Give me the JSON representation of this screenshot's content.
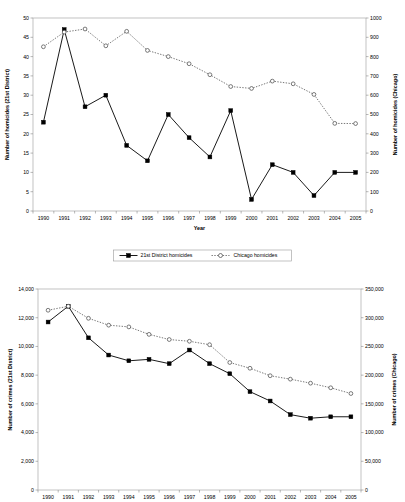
{
  "chart_data": [
    {
      "type": "line",
      "id": "homicides",
      "title": "",
      "xlabel": "Year",
      "ylabel": "Number of homicides (21st District)",
      "y2label": "Number of homicides (Chicago)",
      "categories": [
        "1990",
        "1991",
        "1992",
        "1993",
        "1994",
        "1995",
        "1996",
        "1997",
        "1998",
        "1999",
        "2000",
        "2001",
        "2002",
        "2003",
        "2004",
        "2005"
      ],
      "ylim": [
        0,
        50
      ],
      "yticks": [
        "0",
        "5",
        "10",
        "15",
        "20",
        "25",
        "30",
        "35",
        "40",
        "45",
        "50"
      ],
      "y2lim": [
        0,
        1000
      ],
      "y2ticks": [
        "0",
        "100",
        "200",
        "300",
        "400",
        "500",
        "600",
        "700",
        "800",
        "900",
        "1000"
      ],
      "grid": false,
      "legend_position": "bottom",
      "series": [
        {
          "name": "21st District homicides",
          "axis": "left",
          "marker": "filled-square",
          "line": "solid",
          "values": [
            23,
            47,
            27,
            30,
            17,
            13,
            25,
            19,
            14,
            26,
            3,
            12,
            10,
            4,
            10,
            10
          ]
        },
        {
          "name": "Chicago homicides",
          "axis": "right",
          "marker": "open-circle",
          "line": "dotted",
          "values": [
            851,
            927,
            943,
            856,
            931,
            832,
            800,
            763,
            706,
            645,
            635,
            673,
            659,
            604,
            454,
            453
          ]
        }
      ]
    },
    {
      "type": "line",
      "id": "crimes",
      "title": "",
      "xlabel": "",
      "ylabel": "Number of crimes (21st District)",
      "y2label": "Number of crimes (Chicago)",
      "categories": [
        "1990",
        "1991",
        "1992",
        "1993",
        "1994",
        "1995",
        "1996",
        "1997",
        "1998",
        "1999",
        "2000",
        "2001",
        "2002",
        "2003",
        "2004",
        "2005"
      ],
      "ylim": [
        0,
        14000
      ],
      "yticks": [
        "0",
        "2,000",
        "4,000",
        "6,000",
        "8,000",
        "10,000",
        "12,000",
        "14,000"
      ],
      "y2lim": [
        0,
        350000
      ],
      "y2ticks": [
        "0",
        "50,000",
        "100,000",
        "150,000",
        "200,000",
        "250,000",
        "300,000",
        "350,000"
      ],
      "grid": false,
      "legend_position": "none",
      "series": [
        {
          "name": "21st District crimes",
          "axis": "left",
          "marker": "filled-square",
          "line": "solid",
          "values": [
            11700,
            12800,
            10600,
            9400,
            9000,
            9100,
            8800,
            9750,
            8800,
            8100,
            6850,
            6200,
            5250,
            5000,
            5100,
            5100
          ]
        },
        {
          "name": "Chicago crimes",
          "axis": "right",
          "marker": "open-circle",
          "line": "dotted",
          "values": [
            313000,
            320000,
            299000,
            287000,
            284000,
            271000,
            262000,
            259000,
            253000,
            222000,
            212000,
            199000,
            193000,
            186000,
            178000,
            168000
          ]
        }
      ]
    }
  ]
}
